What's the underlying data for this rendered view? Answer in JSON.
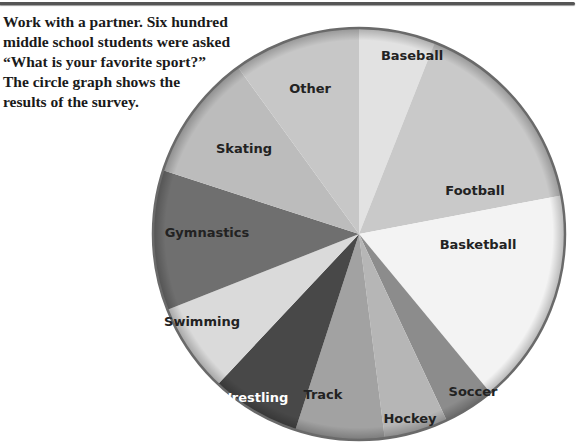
{
  "prompt": {
    "lines": [
      "Work with a partner. Six hundred",
      "middle school students were asked",
      "“What is your favorite sport?”",
      "The circle graph shows the",
      "results of the survey."
    ]
  },
  "chart_data": {
    "type": "pie",
    "title": "",
    "total_respondents": 600,
    "categories": [
      "Baseball",
      "Football",
      "Basketball",
      "Soccer",
      "Hockey",
      "Track",
      "Wrestling",
      "Swimming",
      "Gymnastics",
      "Skating",
      "Other"
    ],
    "values": [
      6,
      16,
      17,
      4,
      5,
      7,
      7,
      7,
      11,
      10,
      10
    ],
    "value_unit": "approx. percent of circle (estimated from slice angles; no values printed)",
    "start_angle_deg": 0,
    "direction": "clockwise",
    "colors": [
      "#e2e2e2",
      "#c9c9c9",
      "#f3f3f3",
      "#8c8c8c",
      "#b6b6b6",
      "#a2a2a2",
      "#484848",
      "#dadada",
      "#6f6f6f",
      "#bcbcbc",
      "#c7c7c7"
    ],
    "label_colors": [
      "#222222",
      "#222222",
      "#222222",
      "#222222",
      "#222222",
      "#222222",
      "#ffffff",
      "#222222",
      "#222222",
      "#222222",
      "#222222"
    ],
    "label_positions": [
      [
        412,
        60
      ],
      [
        475,
        195
      ],
      [
        478,
        249
      ],
      [
        473,
        396
      ],
      [
        410,
        423
      ],
      [
        323,
        399
      ],
      [
        253,
        402
      ],
      [
        202,
        326
      ],
      [
        207,
        237
      ],
      [
        244,
        153
      ],
      [
        310,
        93
      ]
    ],
    "illustrations": [
      "baseball-player",
      "football-player",
      "basketball-player",
      "soccer-player",
      "hockey-player",
      "track-runner",
      "wrestler",
      "swimmer",
      "gymnast",
      "figure-skater"
    ],
    "legend": "none (labels inside slices)",
    "center": [
      359,
      234
    ],
    "radius": 206
  }
}
